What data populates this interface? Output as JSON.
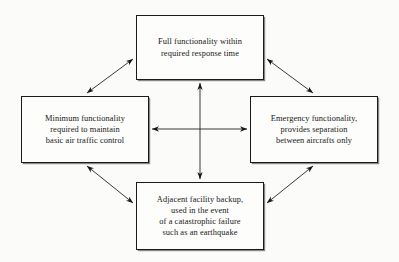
{
  "figure": {
    "type": "block-diagram",
    "background_color": "#fbfbf9",
    "line_color": "#1a1a1a",
    "layout": "diamond-four-node"
  },
  "nodes": [
    {
      "id": "full-functionality",
      "position": "top",
      "text": "Full functionality within\nrequired response time",
      "lines": [
        "Full functionality within",
        "required response time"
      ]
    },
    {
      "id": "minimum-functionality",
      "position": "left",
      "text": "Minimum functionality\nrequired to maintain\nbasic air traffic control",
      "lines": [
        "Minimum functionality",
        "required to maintain",
        "basic air traffic control"
      ]
    },
    {
      "id": "emergency-functionality",
      "position": "right",
      "text": "Emergency functionality,\nprovides separation\nbetween aircrafts only",
      "lines": [
        "Emergency functionality,",
        "provides separation",
        "between aircrafts only"
      ]
    },
    {
      "id": "adjacent-facility-backup",
      "position": "bottom",
      "text": "Adjacent facility backup,\nused in the event\nof a catastrophic failure\nsuch as an earthquake",
      "lines": [
        "Adjacent facility backup,",
        "used in the event",
        "of a catastrophic failure",
        "such as an earthquake"
      ]
    }
  ],
  "connectors": [
    {
      "id": "top-to-left",
      "from": "full-functionality",
      "to": "minimum-functionality",
      "style": "double-headed-diagonal"
    },
    {
      "id": "top-to-right",
      "from": "full-functionality",
      "to": "emergency-functionality",
      "style": "double-headed-diagonal"
    },
    {
      "id": "left-to-bottom",
      "from": "minimum-functionality",
      "to": "adjacent-facility-backup",
      "style": "double-headed-diagonal"
    },
    {
      "id": "right-to-bottom",
      "from": "emergency-functionality",
      "to": "adjacent-facility-backup",
      "style": "double-headed-diagonal"
    },
    {
      "id": "left-to-right",
      "from": "minimum-functionality",
      "to": "emergency-functionality",
      "style": "double-headed-horizontal"
    },
    {
      "id": "top-to-bottom",
      "from": "full-functionality",
      "to": "adjacent-facility-backup",
      "style": "double-headed-vertical"
    }
  ]
}
